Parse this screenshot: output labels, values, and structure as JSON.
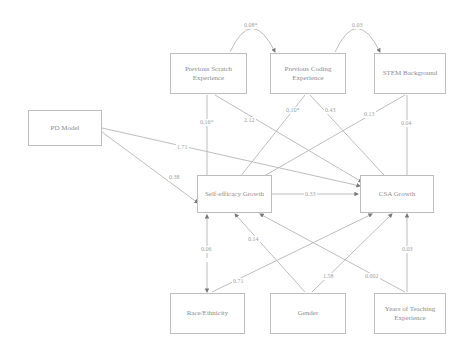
{
  "nodes": {
    "scratch": "Previous Scratch Experience",
    "coding": "Previous Coding Experience",
    "stem": "STEM Background",
    "pd": "PD Model",
    "self_efficacy": "Self-efficacy Growth",
    "csa": "CSA Growth",
    "race": "Race/Ethnicity",
    "gender": "Gender",
    "years": "Years of Teaching Experience"
  },
  "paths": {
    "scratch_coding_cov": "0.08*",
    "coding_stem_cov": "0.03",
    "scratch_to_se": "0.16*",
    "scratch_to_csa": "2.12",
    "coding_to_se": "0.10*",
    "coding_to_csa": "0.43",
    "stem_to_se": "0.13",
    "stem_to_csa": "0.04",
    "pd_to_csa": "1.71",
    "pd_to_se": "0.38",
    "se_to_csa": "0.33",
    "race_to_se": "0.06",
    "race_to_csa": "0.71",
    "gender_to_se": "0.14",
    "gender_to_csa": "1.58",
    "years_to_se": "0.002",
    "years_to_csa": "0.03"
  }
}
